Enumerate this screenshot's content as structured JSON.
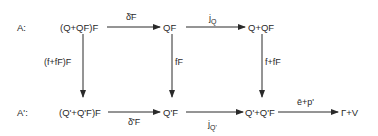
{
  "diagram": {
    "type": "commutative-diagram",
    "rows": [
      {
        "label": "A:",
        "nodes": [
          "(Q+QF)F",
          "QF",
          "Q+QF"
        ],
        "arrows": [
          {
            "from": "(Q+QF)F",
            "to": "QF",
            "label": "δ̄F",
            "label_position": "above"
          },
          {
            "from": "QF",
            "to": "Q+QF",
            "label": "jQ",
            "label_position": "above"
          }
        ]
      },
      {
        "label": "A':",
        "nodes": [
          "(Q'+Q'F)F",
          "Q'F",
          "Q'+Q'F",
          "Γ+V"
        ],
        "arrows": [
          {
            "from": "(Q'+Q'F)F",
            "to": "Q'F",
            "label": "δ̄'F",
            "label_position": "below"
          },
          {
            "from": "Q'F",
            "to": "Q'+Q'F",
            "label": "jQ'",
            "label_position": "below"
          },
          {
            "from": "Q'+Q'F",
            "to": "Γ+V",
            "label": "ē+p'",
            "label_position": "above"
          }
        ]
      }
    ],
    "vertical_arrows": [
      {
        "from": "(Q+QF)F",
        "to": "(Q'+Q'F)F",
        "label": "(f+fF)F",
        "label_position": "left"
      },
      {
        "from": "QF",
        "to": "Q'F",
        "label": "fF",
        "label_position": "right"
      },
      {
        "from": "Q+QF",
        "to": "Q'+Q'F",
        "label": "f+fF",
        "label_position": "right"
      }
    ]
  },
  "text": {
    "row_a_label": "A:",
    "row_a2_label": "A':",
    "node_a1": "(Q+QF)F",
    "node_a2": "QF",
    "node_a3": "Q+QF",
    "node_b1": "(Q'+Q'F)F",
    "node_b2": "Q'F",
    "node_b3": "Q'+Q'F",
    "node_b4": "Γ+V",
    "arrow_delta_f": "δ̄F",
    "arrow_jq_main": "j",
    "arrow_jq_sub": "Q",
    "arrow_delta_prime_f": "δ̄'F",
    "arrow_jq_prime_main": "j",
    "arrow_jq_prime_sub": "Q'",
    "arrow_e_p": "ē+p'",
    "arrow_ffF_F": "(f+fF)F",
    "arrow_fF": "fF",
    "arrow_f_plus_fF": "f+fF"
  }
}
